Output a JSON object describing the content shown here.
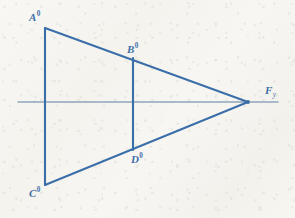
{
  "figure": {
    "name": "perspective-vanishing-point-construction",
    "background_color": "#f6f5f0",
    "line_color": "#3a6ea8",
    "horizon_color": "#8fa5bd",
    "label_color": "#3f6fa8",
    "width": 295,
    "height": 218
  },
  "labels": {
    "a": {
      "base": "A",
      "sup": "0"
    },
    "b": {
      "base": "B",
      "sup": "0"
    },
    "c": {
      "base": "C",
      "sup": "0"
    },
    "d": {
      "base": "D",
      "sup": "0"
    },
    "f": {
      "base": "F",
      "sub": "y"
    }
  },
  "geometry": {
    "points": {
      "A0": {
        "x": 45,
        "y": 28
      },
      "B0": {
        "x": 133,
        "y": 58
      },
      "C0": {
        "x": 45,
        "y": 185
      },
      "D0": {
        "x": 133,
        "y": 150
      },
      "Fy": {
        "x": 248,
        "y": 102
      }
    },
    "horizon": {
      "x1": 18,
      "y1": 102,
      "x2": 278,
      "y2": 102
    },
    "segments": [
      {
        "name": "edge-A0-C0",
        "from": "A0",
        "to": "C0"
      },
      {
        "name": "edge-B0-D0",
        "from": "B0",
        "to": "D0"
      },
      {
        "name": "ray-A0-Fy",
        "from": "A0",
        "to": "Fy"
      },
      {
        "name": "ray-C0-Fy",
        "from": "C0",
        "to": "Fy"
      }
    ]
  }
}
